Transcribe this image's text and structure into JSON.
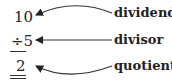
{
  "diagram": {
    "dividend_value": "10",
    "divisor_value": "÷5",
    "quotient_value": "2",
    "labels": {
      "dividend": "dividend",
      "divisor": "divisor",
      "quotient": "quotient"
    },
    "colors": {
      "text": "#222222",
      "arrow": "#333333"
    }
  }
}
